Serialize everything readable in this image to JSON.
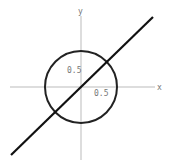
{
  "diagram": {
    "axes": {
      "x_label": "x",
      "y_label": "y",
      "color": "#bbbbbb"
    },
    "circle": {
      "center": [
        0,
        0
      ],
      "radius": 1,
      "color": "#222222"
    },
    "line": {
      "equation": "y = x",
      "color": "#111111"
    },
    "tick_labels": {
      "x_tick": "0.5",
      "y_tick": "0.5"
    }
  }
}
